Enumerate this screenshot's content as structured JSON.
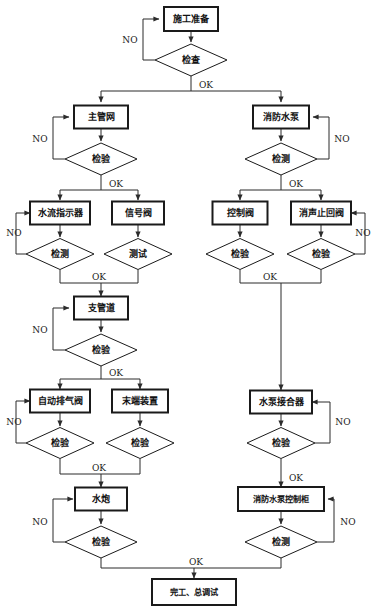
{
  "diagram": {
    "language": "zh",
    "edge_labels": {
      "no": "NO",
      "ok": "OK"
    },
    "colors": {
      "stroke": "#2b2b2b",
      "box_stroke": "#1a1a1a",
      "background": "#ffffff",
      "text": "#111111"
    }
  },
  "nodes": {
    "start": {
      "id": "start",
      "label": "施工准备",
      "shape": "box",
      "x": 191,
      "y": 19,
      "w": 54,
      "h": 24
    },
    "check_start": {
      "id": "check_start",
      "label": "检查",
      "shape": "diamond",
      "x": 191,
      "y": 60,
      "w": 72,
      "h": 32
    },
    "main_pipe": {
      "id": "main_pipe",
      "label": "主管网",
      "shape": "box",
      "x": 101,
      "y": 117,
      "w": 54,
      "h": 23
    },
    "check_main_pipe": {
      "id": "check_main_pipe",
      "label": "检验",
      "shape": "diamond",
      "x": 101,
      "y": 159,
      "w": 72,
      "h": 32
    },
    "fire_pump": {
      "id": "fire_pump",
      "label": "消防水泵",
      "shape": "box",
      "x": 281,
      "y": 117,
      "w": 56,
      "h": 23
    },
    "check_fire_pump": {
      "id": "check_fire_pump",
      "label": "检测",
      "shape": "diamond",
      "x": 281,
      "y": 159,
      "w": 72,
      "h": 32
    },
    "flow_indicator": {
      "id": "flow_indicator",
      "label": "水流指示器",
      "shape": "box",
      "x": 60,
      "y": 213,
      "w": 60,
      "h": 23
    },
    "check_flow_indicator": {
      "id": "check_flow_indicator",
      "label": "检测",
      "shape": "diamond",
      "x": 60,
      "y": 254,
      "w": 68,
      "h": 31
    },
    "signal_valve": {
      "id": "signal_valve",
      "label": "信号阀",
      "shape": "box",
      "x": 138,
      "y": 213,
      "w": 52,
      "h": 23
    },
    "test_signal_valve": {
      "id": "test_signal_valve",
      "label": "测试",
      "shape": "diamond",
      "x": 138,
      "y": 254,
      "w": 68,
      "h": 31
    },
    "control_valve": {
      "id": "control_valve",
      "label": "控制阀",
      "shape": "box",
      "x": 240,
      "y": 213,
      "w": 55,
      "h": 23
    },
    "check_control_valve": {
      "id": "check_control_valve",
      "label": "检验",
      "shape": "diamond",
      "x": 240,
      "y": 254,
      "w": 68,
      "h": 31
    },
    "silent_check_valve": {
      "id": "silent_check_valve",
      "label": "消声止回阀",
      "shape": "box",
      "x": 321,
      "y": 213,
      "w": 60,
      "h": 23
    },
    "check_silent_valve": {
      "id": "check_silent_valve",
      "label": "检验",
      "shape": "diamond",
      "x": 321,
      "y": 254,
      "w": 68,
      "h": 31
    },
    "branch_pipe": {
      "id": "branch_pipe",
      "label": "支管道",
      "shape": "box",
      "x": 101,
      "y": 308,
      "w": 54,
      "h": 23
    },
    "check_branch_pipe": {
      "id": "check_branch_pipe",
      "label": "检验",
      "shape": "diamond",
      "x": 101,
      "y": 350,
      "w": 72,
      "h": 32
    },
    "auto_air_valve": {
      "id": "auto_air_valve",
      "label": "自动排气阀",
      "shape": "box",
      "x": 60,
      "y": 401,
      "w": 60,
      "h": 23
    },
    "check_auto_air_valve": {
      "id": "check_auto_air_valve",
      "label": "检验",
      "shape": "diamond",
      "x": 60,
      "y": 443,
      "w": 68,
      "h": 31
    },
    "end_device": {
      "id": "end_device",
      "label": "末端装置",
      "shape": "box",
      "x": 140,
      "y": 401,
      "w": 56,
      "h": 23
    },
    "check_end_device": {
      "id": "check_end_device",
      "label": "检验",
      "shape": "diamond",
      "x": 140,
      "y": 443,
      "w": 68,
      "h": 31
    },
    "pump_adapter": {
      "id": "pump_adapter",
      "label": "水泵接合器",
      "shape": "box",
      "x": 281,
      "y": 402,
      "w": 62,
      "h": 23
    },
    "check_pump_adapter": {
      "id": "check_pump_adapter",
      "label": "检验",
      "shape": "diamond",
      "x": 281,
      "y": 443,
      "w": 68,
      "h": 31
    },
    "water_cannon": {
      "id": "water_cannon",
      "label": "水炮",
      "shape": "box",
      "x": 101,
      "y": 499,
      "w": 52,
      "h": 23
    },
    "check_water_cannon": {
      "id": "check_water_cannon",
      "label": "检验",
      "shape": "diamond",
      "x": 101,
      "y": 542,
      "w": 72,
      "h": 32
    },
    "pump_control_cabinet": {
      "id": "pump_control_cabinet",
      "label": "消防水泵控制柜",
      "shape": "box",
      "x": 281,
      "y": 499,
      "w": 86,
      "h": 24
    },
    "check_pump_cabinet": {
      "id": "check_pump_cabinet",
      "label": "检测",
      "shape": "diamond",
      "x": 281,
      "y": 542,
      "w": 72,
      "h": 32
    },
    "finish": {
      "id": "finish",
      "label": "完工、总调试",
      "shape": "box",
      "x": 194,
      "y": 592,
      "w": 84,
      "h": 26
    }
  },
  "node_order": [
    "start",
    "check_start",
    "main_pipe",
    "check_main_pipe",
    "fire_pump",
    "check_fire_pump",
    "flow_indicator",
    "check_flow_indicator",
    "signal_valve",
    "test_signal_valve",
    "control_valve",
    "check_control_valve",
    "silent_check_valve",
    "check_silent_valve",
    "branch_pipe",
    "check_branch_pipe",
    "auto_air_valve",
    "check_auto_air_valve",
    "end_device",
    "check_end_device",
    "pump_adapter",
    "check_pump_adapter",
    "water_cannon",
    "check_water_cannon",
    "pump_control_cabinet",
    "check_pump_cabinet",
    "finish"
  ],
  "edges": [
    {
      "name": "start-to-check-start",
      "d": "M191,31 L191,42",
      "arrow": "end"
    },
    {
      "name": "check-start-no-loop",
      "d": "M155,60 L143,60 L143,19 L159,19",
      "arrow": "end"
    },
    {
      "name": "check-start-ok-trunk",
      "d": "M191,76 L191,91",
      "arrow": "none"
    },
    {
      "name": "check-start-ok-split",
      "d": "M101,91 L281,91",
      "arrow": "none"
    },
    {
      "name": "ok-to-main-pipe",
      "d": "M101,91 L101,102",
      "arrow": "end"
    },
    {
      "name": "ok-to-fire-pump",
      "d": "M281,91 L281,102",
      "arrow": "end"
    },
    {
      "name": "main-pipe-to-check",
      "d": "M101,129 L101,141",
      "arrow": "end"
    },
    {
      "name": "check-main-pipe-no-loop",
      "d": "M65,159 L53,159 L53,117 L69,117",
      "arrow": "end"
    },
    {
      "name": "check-main-pipe-ok-trunk",
      "d": "M101,175 L101,190",
      "arrow": "none"
    },
    {
      "name": "check-main-pipe-ok-split",
      "d": "M60,190 L138,190",
      "arrow": "none"
    },
    {
      "name": "ok-to-flow-indicator",
      "d": "M60,190 L60,200",
      "arrow": "end"
    },
    {
      "name": "ok-to-signal-valve",
      "d": "M138,190 L138,200",
      "arrow": "end"
    },
    {
      "name": "fire-pump-to-check",
      "d": "M281,129 L281,141",
      "arrow": "end"
    },
    {
      "name": "check-fire-pump-no-loop",
      "d": "M317,159 L329,159 L329,117 L313,117",
      "arrow": "end"
    },
    {
      "name": "check-fire-pump-ok-trunk",
      "d": "M281,175 L281,190",
      "arrow": "none"
    },
    {
      "name": "check-fire-pump-ok-split",
      "d": "M240,190 L321,190",
      "arrow": "none"
    },
    {
      "name": "ok-to-control-valve",
      "d": "M240,190 L240,200",
      "arrow": "end"
    },
    {
      "name": "ok-to-silent-valve",
      "d": "M321,190 L321,200",
      "arrow": "end"
    },
    {
      "name": "flow-indicator-to-check",
      "d": "M60,225 L60,237",
      "arrow": "end"
    },
    {
      "name": "check-flow-indicator-no-loop",
      "d": "M26,254 L16,254 L16,213 L30,213",
      "arrow": "end"
    },
    {
      "name": "signal-valve-to-test",
      "d": "M138,225 L138,237",
      "arrow": "end"
    },
    {
      "name": "left-row3-merge",
      "d": "M60,270 L60,283 L138,283 L138,270",
      "arrow": "none"
    },
    {
      "name": "left-row3-ok-down",
      "d": "M101,283 L101,296",
      "arrow": "end"
    },
    {
      "name": "control-valve-to-check",
      "d": "M240,225 L240,237",
      "arrow": "end"
    },
    {
      "name": "silent-valve-to-check",
      "d": "M321,225 L321,237",
      "arrow": "end"
    },
    {
      "name": "check-silent-valve-no-loop",
      "d": "M355,254 L365,254 L365,213 L351,213",
      "arrow": "end"
    },
    {
      "name": "right-row3-merge",
      "d": "M240,270 L240,283 L321,283 L321,270",
      "arrow": "none"
    },
    {
      "name": "right-long-down-to-pump-adapter",
      "d": "M281,283 L281,390",
      "arrow": "end"
    },
    {
      "name": "branch-pipe-to-check",
      "d": "M101,320 L101,332",
      "arrow": "end"
    },
    {
      "name": "check-branch-pipe-no-loop",
      "d": "M65,350 L53,350 L53,308 L69,308",
      "arrow": "end"
    },
    {
      "name": "check-branch-pipe-ok-trunk",
      "d": "M101,366 L101,379",
      "arrow": "none"
    },
    {
      "name": "check-branch-pipe-ok-split",
      "d": "M60,379 L140,379",
      "arrow": "none"
    },
    {
      "name": "ok-to-auto-air-valve",
      "d": "M60,379 L60,389",
      "arrow": "end"
    },
    {
      "name": "ok-to-end-device",
      "d": "M140,379 L140,389",
      "arrow": "end"
    },
    {
      "name": "auto-air-valve-to-check",
      "d": "M60,413 L60,426",
      "arrow": "end"
    },
    {
      "name": "check-auto-air-no-loop",
      "d": "M26,443 L16,443 L16,401 L30,401",
      "arrow": "end"
    },
    {
      "name": "end-device-to-check",
      "d": "M140,413 L140,426",
      "arrow": "end"
    },
    {
      "name": "left-row5-merge",
      "d": "M60,459 L60,474 L140,474 L140,459",
      "arrow": "none"
    },
    {
      "name": "left-row5-ok-down",
      "d": "M101,474 L101,487",
      "arrow": "end"
    },
    {
      "name": "pump-adapter-to-check",
      "d": "M281,414 L281,426",
      "arrow": "end"
    },
    {
      "name": "check-pump-adapter-no-loop",
      "d": "M315,443 L330,443 L330,402 L312,402",
      "arrow": "end"
    },
    {
      "name": "check-pump-adapter-ok-down",
      "d": "M281,459 L281,487",
      "arrow": "end"
    },
    {
      "name": "water-cannon-to-check",
      "d": "M101,511 L101,524",
      "arrow": "end"
    },
    {
      "name": "check-water-cannon-no-loop",
      "d": "M65,542 L53,542 L53,499 L73,499",
      "arrow": "end"
    },
    {
      "name": "pump-cabinet-to-check",
      "d": "M281,511 L281,524",
      "arrow": "end"
    },
    {
      "name": "check-pump-cabinet-no-loop",
      "d": "M317,542 L334,542 L334,499 L328,499",
      "arrow": "end"
    },
    {
      "name": "bottom-merge",
      "d": "M101,558 L101,568 L281,568 L281,558",
      "arrow": "none"
    },
    {
      "name": "bottom-ok-to-finish",
      "d": "M194,568 L194,578",
      "arrow": "end"
    }
  ],
  "edge_text": [
    {
      "name": "label-no-check-start",
      "text": "NO",
      "x": 130,
      "y": 40
    },
    {
      "name": "label-ok-check-start",
      "text": "OK",
      "x": 206,
      "y": 85
    },
    {
      "name": "label-no-check-main-pipe",
      "text": "NO",
      "x": 40,
      "y": 139
    },
    {
      "name": "label-ok-check-main-pipe",
      "text": "OK",
      "x": 116,
      "y": 184
    },
    {
      "name": "label-no-check-fire-pump",
      "text": "NO",
      "x": 342,
      "y": 139
    },
    {
      "name": "label-ok-check-fire-pump",
      "text": "OK",
      "x": 296,
      "y": 184
    },
    {
      "name": "label-no-check-flow-indicator",
      "text": "NO",
      "x": 14,
      "y": 233
    },
    {
      "name": "label-ok-left-row3",
      "text": "OK",
      "x": 99,
      "y": 277
    },
    {
      "name": "label-no-check-silent-valve",
      "text": "NO",
      "x": 363,
      "y": 233
    },
    {
      "name": "label-ok-right-row3",
      "text": "OK",
      "x": 270,
      "y": 277
    },
    {
      "name": "label-no-check-branch-pipe",
      "text": "NO",
      "x": 40,
      "y": 330
    },
    {
      "name": "label-ok-check-branch-pipe",
      "text": "OK",
      "x": 116,
      "y": 373
    },
    {
      "name": "label-no-check-auto-air",
      "text": "NO",
      "x": 14,
      "y": 422
    },
    {
      "name": "label-ok-left-row5",
      "text": "OK",
      "x": 99,
      "y": 468
    },
    {
      "name": "label-no-check-pump-adapter",
      "text": "NO",
      "x": 343,
      "y": 422
    },
    {
      "name": "label-ok-check-pump-adapter",
      "text": "OK",
      "x": 296,
      "y": 478
    },
    {
      "name": "label-no-check-water-cannon",
      "text": "NO",
      "x": 40,
      "y": 522
    },
    {
      "name": "label-no-check-pump-cabinet",
      "text": "NO",
      "x": 348,
      "y": 522
    },
    {
      "name": "label-ok-bottom",
      "text": "OK",
      "x": 196,
      "y": 562
    }
  ]
}
